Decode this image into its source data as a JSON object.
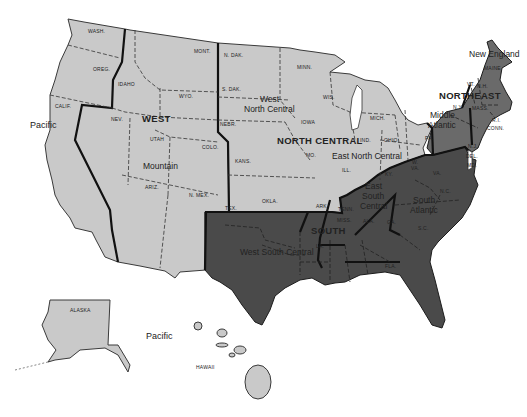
{
  "map": {
    "title": "United States Census Regions and Divisions",
    "colors": {
      "west_north_central": "#c9c9c9",
      "south": "#4a4a4a",
      "northeast": "#6a6a6a",
      "background": "#ffffff"
    },
    "regions": [
      {
        "name": "WEST",
        "divisions": [
          "Pacific",
          "Mountain"
        ]
      },
      {
        "name": "NORTH CENTRAL",
        "divisions": [
          "West North Central",
          "East North Central"
        ]
      },
      {
        "name": "SOUTH",
        "divisions": [
          "West South Central",
          "East South Central",
          "South Atlantic"
        ]
      },
      {
        "name": "NORTHEAST",
        "divisions": [
          "Middle Atlantic",
          "New England"
        ]
      }
    ],
    "region_labels": {
      "west": "WEST",
      "north_central": "NORTH CENTRAL",
      "south": "SOUTH",
      "northeast": "NORTHEAST"
    },
    "division_labels": {
      "pacific_mainland": "Pacific",
      "pacific_offshore": "Pacific",
      "mountain": "Mountain",
      "west_north_central": "West\nNorth Central",
      "west_north_central_line1": "West",
      "west_north_central_line2": "North Central",
      "east_north_central": "East North Central",
      "west_south_central": "West South Central",
      "east_south_central_line1": "East",
      "east_south_central_line2": "South",
      "east_south_central_line3": "Central",
      "south_atlantic_line1": "South",
      "south_atlantic_line2": "Atlantic",
      "middle_atlantic_line1": "Middle",
      "middle_atlantic_line2": "Atlantic",
      "new_england": "New England"
    },
    "state_labels": {
      "wash": "WASH.",
      "oreg": "OREG.",
      "calif": "CALIF.",
      "idaho": "IDAHO",
      "nev": "NEV.",
      "mont": "MONT.",
      "wyo": "WYO.",
      "utah": "UTAH",
      "colo": "COLO.",
      "ariz": "ARIZ.",
      "n_mex": "N. MEX.",
      "n_dak": "N. DAK.",
      "s_dak": "S. DAK.",
      "nebr": "NEBR.",
      "kans": "KANS.",
      "minn": "MINN.",
      "iowa": "IOWA",
      "mo": "MO.",
      "wis": "WIS.",
      "mich": "MICH.",
      "ill": "ILL.",
      "ind": "IND.",
      "ohio": "OHIO",
      "tex": "TEX.",
      "okla": "OKLA.",
      "ark": "ARK.",
      "la": "LA.",
      "tenn": "TENN.",
      "miss": "MISS.",
      "ala": "ALA.",
      "ky": "KY.",
      "ga": "GA.",
      "fla": "FLA.",
      "sc": "S.C.",
      "nc": "N.C.",
      "va": "VA.",
      "w_va_1": "W.",
      "w_va_2": "VA.",
      "md": "MD.",
      "del": "DEL.",
      "nj": "N.J.",
      "pa": "PA.",
      "ny": "N.Y.",
      "vt": "VT.",
      "nh": "N.H.",
      "maine": "MAINE",
      "mass": "MASS.",
      "ri": "R.I.",
      "conn": "CONN.",
      "alaska": "ALASKA",
      "hawaii": "HAWAII"
    }
  }
}
